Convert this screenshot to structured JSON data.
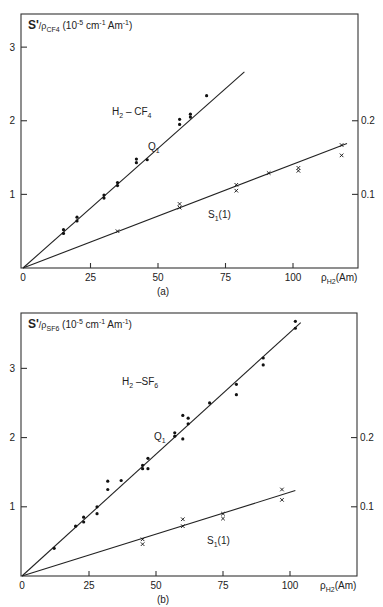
{
  "chart_data": [
    {
      "type": "scatter",
      "panel_label": "(a)",
      "title": "S'/ρCF4 (10^-5 cm^-1 Am^-1)",
      "ylabel_main": "S'",
      "ylabel_sub": "/ρ",
      "ylabel_subscript": "CF4",
      "ylabel_units": "(10",
      "ylabel_exp": "-5",
      "ylabel_units2": " cm",
      "ylabel_exp2": "-1",
      "ylabel_units3": " Am",
      "ylabel_exp3": "-1",
      "ylabel_close": ")",
      "xlabel": "ρH2 (Am)",
      "xlabel_main": "ρ",
      "xlabel_sub": "H2",
      "xlabel_units": "(Am)",
      "system_label": "H2 – CF4",
      "system_main": "H",
      "system_sub1": "2",
      "system_mid": " – CF",
      "system_sub2": "4",
      "x_ticks": [
        0,
        25,
        50,
        75,
        100
      ],
      "y_ticks_left": [
        1,
        2,
        3
      ],
      "y_ticks_right": [
        0.1,
        0.2
      ],
      "xlim": [
        0,
        122
      ],
      "ylim_left": [
        0,
        3.45
      ],
      "ylim_right": [
        0,
        0.345
      ],
      "series": [
        {
          "name": "Q1",
          "label_main": "Q",
          "label_sub": "1",
          "axis": "left",
          "marker": "dot",
          "fit_slope": 0.0325,
          "fit_xmax": 82,
          "points": [
            [
              15,
              0.47
            ],
            [
              15,
              0.52
            ],
            [
              20,
              0.64
            ],
            [
              20,
              0.69
            ],
            [
              30,
              0.95
            ],
            [
              30,
              0.99
            ],
            [
              35,
              1.12
            ],
            [
              35,
              1.16
            ],
            [
              42,
              1.43
            ],
            [
              42,
              1.48
            ],
            [
              46,
              1.47
            ],
            [
              58,
              1.95
            ],
            [
              58,
              2.02
            ],
            [
              62,
              2.05
            ],
            [
              62,
              2.09
            ],
            [
              68,
              2.34
            ]
          ]
        },
        {
          "name": "S1(1)",
          "label_main": "S",
          "label_sub": "1",
          "label_tail": "(1)",
          "axis": "right",
          "marker": "cross",
          "fit_slope": 0.00141,
          "fit_xmax": 120,
          "points": [
            [
              35,
              0.05
            ],
            [
              58,
              0.082
            ],
            [
              58,
              0.087
            ],
            [
              79,
              0.105
            ],
            [
              79,
              0.113
            ],
            [
              91,
              0.129
            ],
            [
              102,
              0.132
            ],
            [
              102,
              0.136
            ],
            [
              118,
              0.153
            ],
            [
              118,
              0.167
            ]
          ]
        }
      ]
    },
    {
      "type": "scatter",
      "panel_label": "(b)",
      "title": "S'/ρSF6 (10^-5 cm^-1 Am^-1)",
      "ylabel_main": "S'",
      "ylabel_sub": "/ρ",
      "ylabel_subscript": "SF6",
      "ylabel_units": "(10",
      "ylabel_exp": "-5",
      "ylabel_units2": " cm",
      "ylabel_exp2": "-1",
      "ylabel_units3": "  Am",
      "ylabel_exp3": "-1",
      "ylabel_close": ")",
      "xlabel": "ρH2 (Am)",
      "xlabel_main": "ρ",
      "xlabel_sub": "H2",
      "xlabel_units": "(Am)",
      "system_label": "H2 –SF6",
      "system_main": "H",
      "system_sub1": "2",
      "system_mid": " –SF",
      "system_sub2": "6",
      "x_ticks": [
        0,
        25,
        50,
        75,
        100
      ],
      "y_ticks_left": [
        1,
        2,
        3
      ],
      "y_ticks_right": [
        0.1,
        0.2
      ],
      "xlim": [
        0,
        122
      ],
      "ylim_left": [
        0,
        3.8
      ],
      "ylim_right": [
        0,
        0.38
      ],
      "series": [
        {
          "name": "Q1",
          "label_main": "Q",
          "label_sub": "1",
          "axis": "left",
          "marker": "dot",
          "fit_slope": 0.0352,
          "fit_xmax": 104,
          "points": [
            [
              12,
              0.4
            ],
            [
              20,
              0.72
            ],
            [
              23,
              0.78
            ],
            [
              23,
              0.85
            ],
            [
              28,
              0.9
            ],
            [
              28,
              1.0
            ],
            [
              32,
              1.25
            ],
            [
              32,
              1.37
            ],
            [
              37,
              1.38
            ],
            [
              45,
              1.55
            ],
            [
              45,
              1.6
            ],
            [
              47,
              1.55
            ],
            [
              47,
              1.7
            ],
            [
              57,
              2.02
            ],
            [
              57,
              2.07
            ],
            [
              60,
              1.98
            ],
            [
              60,
              2.32
            ],
            [
              62,
              2.2
            ],
            [
              62,
              2.28
            ],
            [
              70,
              2.5
            ],
            [
              80,
              2.62
            ],
            [
              80,
              2.77
            ],
            [
              90,
              3.05
            ],
            [
              90,
              3.15
            ],
            [
              102,
              3.58
            ],
            [
              102,
              3.68
            ]
          ]
        },
        {
          "name": "S1(1)",
          "label_main": "S",
          "label_sub": "1",
          "label_tail": "(1)",
          "axis": "right",
          "marker": "cross",
          "fit_slope": 0.00121,
          "fit_xmax": 102,
          "points": [
            [
              45,
              0.046
            ],
            [
              45,
              0.053
            ],
            [
              60,
              0.072
            ],
            [
              60,
              0.082
            ],
            [
              75,
              0.083
            ],
            [
              75,
              0.09
            ],
            [
              97,
              0.11
            ],
            [
              97,
              0.125
            ]
          ]
        }
      ]
    }
  ]
}
